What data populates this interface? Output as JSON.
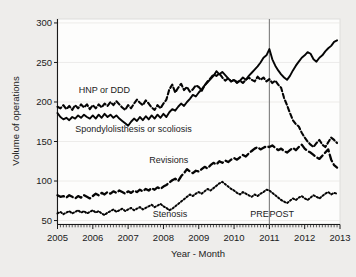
{
  "chart_data": {
    "type": "line",
    "title": "",
    "xlabel": "Year - Month",
    "ylabel": "Volume of operations",
    "xlim": [
      2005.0,
      2013.0
    ],
    "ylim": [
      45,
      305
    ],
    "yticks": [
      50,
      100,
      150,
      200,
      250,
      300
    ],
    "xticks": [
      "2005",
      "2006",
      "2007",
      "2008",
      "2009",
      "2010",
      "2011",
      "2012",
      "2013"
    ],
    "grid": "horizontal-light",
    "legend_position": "inline-annotations",
    "annotations": [
      {
        "text": "HNP or DDD",
        "x": 2005.6,
        "y": 212
      },
      {
        "text": "Spondylolisthesis or scoliosis",
        "x": 2005.5,
        "y": 162
      },
      {
        "text": "Revisions",
        "x": 2007.6,
        "y": 123
      },
      {
        "text": "Stenosis",
        "x": 2007.7,
        "y": 55
      },
      {
        "text": "PRE",
        "x": 2010.72,
        "y": 55
      },
      {
        "text": "POST",
        "x": 2011.35,
        "y": 55
      }
    ],
    "reference_line": {
      "x": 2011.0,
      "label_left": "PRE",
      "label_right": "POST",
      "color": "#7c7c7c"
    },
    "x": [
      2005.0,
      2005.083,
      2005.167,
      2005.25,
      2005.333,
      2005.417,
      2005.5,
      2005.583,
      2005.667,
      2005.75,
      2005.833,
      2005.917,
      2006.0,
      2006.083,
      2006.167,
      2006.25,
      2006.333,
      2006.417,
      2006.5,
      2006.583,
      2006.667,
      2006.75,
      2006.833,
      2006.917,
      2007.0,
      2007.083,
      2007.167,
      2007.25,
      2007.333,
      2007.417,
      2007.5,
      2007.583,
      2007.667,
      2007.75,
      2007.833,
      2007.917,
      2008.0,
      2008.083,
      2008.167,
      2008.25,
      2008.333,
      2008.417,
      2008.5,
      2008.583,
      2008.667,
      2008.75,
      2008.833,
      2008.917,
      2009.0,
      2009.083,
      2009.167,
      2009.25,
      2009.333,
      2009.417,
      2009.5,
      2009.583,
      2009.667,
      2009.75,
      2009.833,
      2009.917,
      2010.0,
      2010.083,
      2010.167,
      2010.25,
      2010.333,
      2010.417,
      2010.5,
      2010.583,
      2010.667,
      2010.75,
      2010.833,
      2010.917,
      2011.0,
      2011.083,
      2011.167,
      2011.25,
      2011.333,
      2011.417,
      2011.5,
      2011.583,
      2011.667,
      2011.75,
      2011.833,
      2011.917,
      2012.0,
      2012.083,
      2012.167,
      2012.25,
      2012.333,
      2012.417,
      2012.5,
      2012.583,
      2012.667,
      2012.75,
      2012.833,
      2012.917
    ],
    "series": [
      {
        "name": "HNP or DDD",
        "linestyle": "short-dash",
        "color": "#050505",
        "values": [
          194,
          192,
          196,
          191,
          195,
          190,
          196,
          192,
          197,
          193,
          197,
          191,
          196,
          192,
          197,
          193,
          198,
          195,
          200,
          196,
          201,
          197,
          193,
          190,
          196,
          192,
          198,
          203,
          199,
          196,
          202,
          198,
          193,
          190,
          196,
          192,
          198,
          203,
          216,
          222,
          212,
          218,
          223,
          215,
          219,
          213,
          216,
          221,
          219,
          214,
          221,
          226,
          230,
          235,
          233,
          236,
          231,
          227,
          230,
          226,
          228,
          225,
          227,
          224,
          228,
          231,
          228,
          226,
          232,
          228,
          231,
          226,
          229,
          224,
          227,
          222,
          218,
          205,
          196,
          186,
          177,
          172,
          169,
          161,
          155,
          150,
          146,
          143,
          148,
          152,
          146,
          143,
          149,
          155,
          152,
          148
        ]
      },
      {
        "name": "Spondylolisthesis or scoliosis",
        "linestyle": "solid",
        "color": "#050505",
        "values": [
          186,
          181,
          178,
          180,
          177,
          181,
          179,
          183,
          180,
          184,
          181,
          179,
          183,
          179,
          184,
          180,
          185,
          181,
          184,
          180,
          183,
          179,
          176,
          173,
          170,
          175,
          179,
          176,
          181,
          177,
          182,
          178,
          183,
          179,
          184,
          180,
          185,
          181,
          187,
          191,
          189,
          194,
          198,
          195,
          200,
          204,
          209,
          207,
          212,
          216,
          221,
          225,
          229,
          233,
          239,
          235,
          238,
          234,
          230,
          226,
          228,
          224,
          227,
          231,
          228,
          233,
          237,
          241,
          245,
          250,
          256,
          259,
          267,
          254,
          246,
          240,
          235,
          231,
          228,
          233,
          240,
          246,
          251,
          256,
          259,
          263,
          261,
          254,
          251,
          256,
          259,
          264,
          268,
          271,
          276,
          278
        ]
      },
      {
        "name": "Revisions",
        "linestyle": "long-dash",
        "color": "#050505",
        "values": [
          82,
          80,
          81,
          79,
          82,
          80,
          78,
          81,
          79,
          82,
          80,
          78,
          81,
          84,
          82,
          85,
          83,
          86,
          84,
          87,
          85,
          88,
          86,
          84,
          87,
          85,
          88,
          86,
          89,
          87,
          90,
          88,
          91,
          89,
          92,
          90,
          93,
          95,
          98,
          101,
          103,
          100,
          106,
          110,
          115,
          112,
          110,
          113,
          112,
          115,
          118,
          116,
          120,
          123,
          121,
          125,
          123,
          126,
          124,
          127,
          129,
          127,
          130,
          133,
          131,
          135,
          138,
          141,
          143,
          140,
          142,
          144,
          143,
          145,
          142,
          139,
          141,
          138,
          136,
          139,
          142,
          139,
          143,
          146,
          141,
          138,
          136,
          133,
          130,
          128,
          132,
          136,
          140,
          127,
          120,
          117
        ]
      },
      {
        "name": "Stenosis",
        "linestyle": "dotted",
        "color": "#050505",
        "values": [
          59,
          61,
          58,
          60,
          62,
          59,
          61,
          63,
          60,
          62,
          59,
          61,
          63,
          60,
          62,
          59,
          57,
          60,
          62,
          64,
          61,
          63,
          65,
          62,
          64,
          66,
          63,
          65,
          67,
          64,
          66,
          68,
          70,
          67,
          69,
          71,
          68,
          66,
          63,
          65,
          68,
          71,
          74,
          77,
          80,
          83,
          81,
          84,
          86,
          84,
          87,
          90,
          88,
          91,
          94,
          97,
          99,
          96,
          93,
          90,
          88,
          85,
          83,
          86,
          84,
          82,
          80,
          83,
          81,
          84,
          86,
          89,
          88,
          85,
          82,
          79,
          76,
          74,
          72,
          75,
          78,
          76,
          79,
          81,
          78,
          76,
          79,
          82,
          80,
          78,
          81,
          84,
          86,
          83,
          85,
          84
        ]
      }
    ]
  }
}
